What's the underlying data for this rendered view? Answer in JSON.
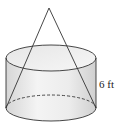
{
  "figure": {
    "shapes": [
      "cylinder",
      "cone"
    ],
    "height_label": "6 ft",
    "colors": {
      "stroke": "#333333",
      "fill_light": "#f2f2f2",
      "fill_dark": "#d9d9d9"
    }
  }
}
